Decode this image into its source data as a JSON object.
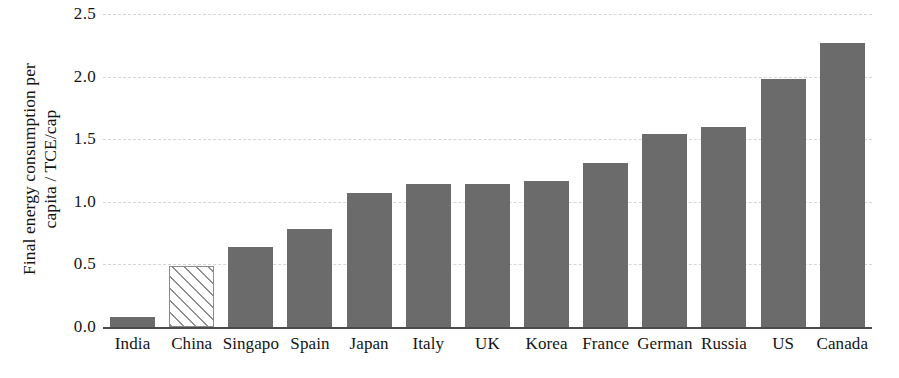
{
  "chart_data": {
    "type": "bar",
    "title": "",
    "xlabel": "",
    "ylabel": "Final energy consumption per\ncapita / TCE/cap",
    "ylim": [
      0.0,
      2.5
    ],
    "ytick_labels": [
      "0.0",
      "0.5",
      "1.0",
      "1.5",
      "2.0",
      "2.5"
    ],
    "ytick_values": [
      0.0,
      0.5,
      1.0,
      1.5,
      2.0,
      2.5
    ],
    "grid": "horizontal-dashed",
    "legend": "none",
    "categories": [
      "India",
      "China",
      "Singapo",
      "Spain",
      "Japan",
      "Italy",
      "UK",
      "Korea",
      "France",
      "German",
      "Russia",
      "US",
      "Canada"
    ],
    "values": [
      0.08,
      0.49,
      0.64,
      0.78,
      1.07,
      1.14,
      1.14,
      1.17,
      1.31,
      1.54,
      1.6,
      1.98,
      2.27
    ],
    "bar_styles": [
      "solid",
      "hatched",
      "solid",
      "solid",
      "solid",
      "solid",
      "solid",
      "solid",
      "solid",
      "solid",
      "solid",
      "solid",
      "solid"
    ],
    "colors": {
      "bar_fill": "#6b6b6b",
      "hatch_line": "#8d8d8d",
      "hatch_background": "#ffffff",
      "hatch_border": "#8a8a8a",
      "axis_line": "#4a4a4a",
      "gridline": "#d6d6d6",
      "text": "#141414",
      "plot_background": "#ffffff"
    }
  }
}
